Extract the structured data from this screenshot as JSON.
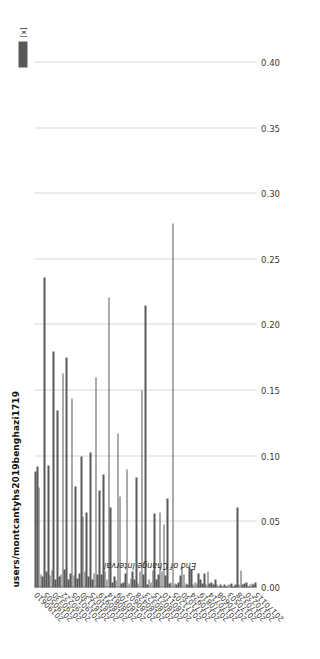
{
  "chart_data": {
    "type": "bar",
    "orientation": "horizontal",
    "title": "users/montcantyhs2019benghazi1719",
    "xlabel": "",
    "ylabel": "End of Change Interval",
    "legend": [
      {
        "label": "[x]",
        "color": "#595959"
      }
    ],
    "legend_position": "top-right",
    "grid": true,
    "grid_axis": "value",
    "xlim": [
      0.0,
      0.4
    ],
    "xticks": [
      "0.00",
      "0.05",
      "0.10",
      "0.15",
      "0.20",
      "0.25",
      "0.30",
      "0.35",
      "0.40"
    ],
    "xtick_values": [
      0.0,
      0.05,
      0.1,
      0.15,
      0.2,
      0.25,
      0.3,
      0.35,
      0.4
    ],
    "bar_color": "#595959",
    "categories": [
      "20170115",
      "20170122",
      "20170129",
      "20170205",
      "20170212",
      "20170220",
      "20170227",
      "20170306",
      "20170313",
      "20170321",
      "20170328",
      "20170404",
      "20170411",
      "20170418",
      "20170426",
      "20170503",
      "20170510",
      "20170517",
      "20170524",
      "20170601",
      "20170608",
      "20170615",
      "20170622",
      "20170629",
      "20170707",
      "20170714",
      "20170721",
      "20170728",
      "20170804",
      "20170812",
      "20170819",
      "20170826",
      "20170902",
      "20170909",
      "20170917",
      "20170924",
      "20171001",
      "20171008",
      "20171015",
      "20171023",
      "20171030",
      "20171106",
      "20171113",
      "20171120",
      "20171128",
      "20171205",
      "20171212",
      "20171219",
      "20171226",
      "20180103",
      "20180110",
      "20180117",
      "20180124",
      "20180131",
      "20180208",
      "20180215",
      "20180222",
      "20180301",
      "20180308",
      "20180316",
      "20180323",
      "20180330",
      "20180406",
      "20180413",
      "20180421",
      "20180428",
      "20180505",
      "20180512",
      "20180519",
      "20180527",
      "20180603",
      "20180610",
      "20180617",
      "20180624",
      "20180702",
      "20180709",
      "20180716",
      "20180723",
      "20180730",
      "20180807",
      "20180814",
      "20180821",
      "20180828",
      "20180904",
      "20180912",
      "20180919",
      "20180926",
      "20181003",
      "20181010",
      "20181018",
      "20181025",
      "20181101",
      "20181108",
      "20181115",
      "20181123",
      "20181130",
      "20181207",
      "20181214",
      "20181221",
      "20181229",
      "20190105",
      "20190112",
      "20190119",
      "20190126",
      "20190203",
      "20190222",
      "20190301",
      "20190308",
      "20190315",
      "20190323",
      "20190330",
      "20190406",
      "20190413",
      "20190420",
      "20190428",
      "20190505",
      "20190512",
      "20190519",
      "20190526",
      "20190603",
      "20190610"
    ],
    "tick_labels": [
      "20170115",
      "20170220",
      "20170328",
      "20170503",
      "20170608",
      "20170714",
      "20170819",
      "20170924",
      "20171030",
      "20171205",
      "20180110",
      "20180215",
      "20180323",
      "20180428",
      "20180603",
      "20180709",
      "20180814",
      "20180919",
      "20181025",
      "20181130",
      "20190105",
      "20190222",
      "20190330",
      "20190505",
      "20190610"
    ],
    "values": [
      0.004,
      0.002,
      0.003,
      0.002,
      0.001,
      0.004,
      0.003,
      0.002,
      0.013,
      0.002,
      0.061,
      0.002,
      0.001,
      0.003,
      0.002,
      0.002,
      0.001,
      0.002,
      0.001,
      0.002,
      0.001,
      0.002,
      0.006,
      0.002,
      0.004,
      0.003,
      0.012,
      0.002,
      0.011,
      0.003,
      0.006,
      0.011,
      0.003,
      0.004,
      0.002,
      0.014,
      0.015,
      0.002,
      0.003,
      0.01,
      0.016,
      0.009,
      0.004,
      0.002,
      0.003,
      0.277,
      0.004,
      0.003,
      0.068,
      0.009,
      0.048,
      0.012,
      0.057,
      0.01,
      0.006,
      0.056,
      0.013,
      0.004,
      0.006,
      0.002,
      0.215,
      0.01,
      0.15,
      0.012,
      0.003,
      0.084,
      0.006,
      0.012,
      0.007,
      0.003,
      0.09,
      0.011,
      0.004,
      0.003,
      0.069,
      0.117,
      0.005,
      0.008,
      0.004,
      0.061,
      0.221,
      0.006,
      0.012,
      0.086,
      0.01,
      0.074,
      0.01,
      0.16,
      0.011,
      0.006,
      0.103,
      0.008,
      0.057,
      0.012,
      0.054,
      0.1,
      0.011,
      0.007,
      0.077,
      0.009,
      0.144,
      0.011,
      0.006,
      0.175,
      0.014,
      0.163,
      0.01,
      0.008,
      0.135,
      0.006,
      0.18,
      0.013,
      0.009,
      0.093,
      0.012,
      0.236,
      0.008,
      0.01,
      0.076,
      0.092,
      0.088
    ]
  }
}
